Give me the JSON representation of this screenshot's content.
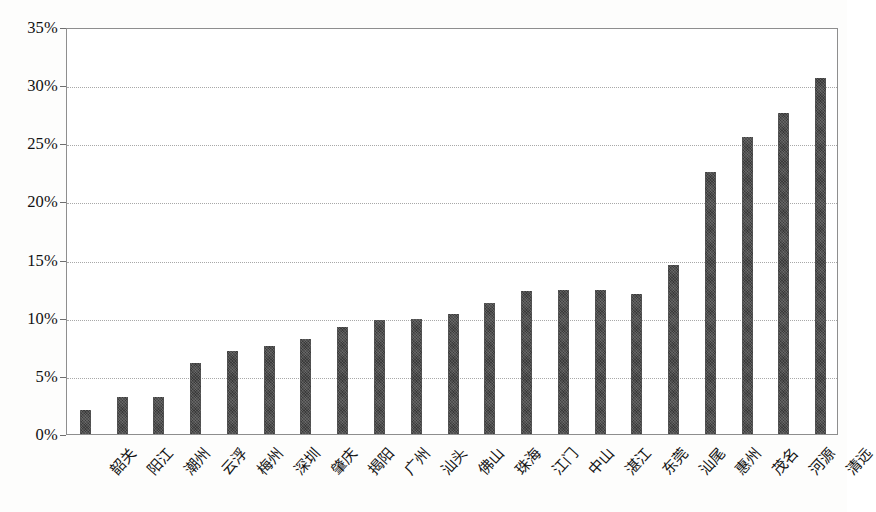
{
  "chart_data": {
    "type": "bar",
    "title": "",
    "subtitle": "",
    "xlabel": "",
    "ylabel": "",
    "ylim": [
      0,
      35
    ],
    "ytick_labels": [
      "0%",
      "5%",
      "10%",
      "15%",
      "20%",
      "25%",
      "30%",
      "35%"
    ],
    "ytick_values": [
      0,
      5,
      10,
      15,
      20,
      25,
      30,
      35
    ],
    "grid": true,
    "legend": false,
    "legend_position": "none",
    "value_unit": "%",
    "bar_color": "#3a3a3a",
    "categories": [
      "韶关",
      "阳江",
      "潮州",
      "云浮",
      "梅州",
      "深圳",
      "肇庆",
      "揭阳",
      "广州",
      "汕头",
      "佛山",
      "珠海",
      "江门",
      "中山",
      "湛江",
      "东莞",
      "汕尾",
      "惠州",
      "茂名",
      "河源",
      "清远"
    ],
    "values": [
      2.1,
      3.2,
      3.2,
      6.1,
      7.1,
      7.6,
      8.2,
      9.2,
      9.8,
      9.9,
      10.3,
      11.3,
      12.3,
      12.4,
      12.4,
      12.0,
      14.5,
      22.5,
      25.5,
      27.6,
      30.6
    ]
  }
}
